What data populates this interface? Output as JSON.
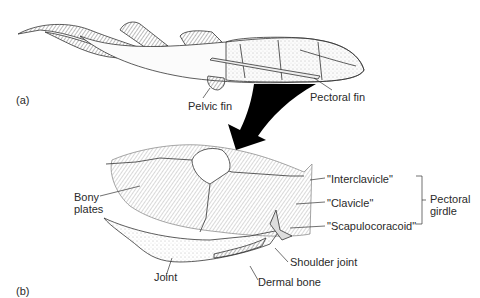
{
  "figure": {
    "panel_a": {
      "id_label": "(a)",
      "labels": {
        "pelvic_fin": "Pelvic fin",
        "pectoral_fin": "Pectoral fin"
      }
    },
    "panel_b": {
      "id_label": "(b)",
      "labels": {
        "bony_plates_line1": "Bony",
        "bony_plates_line2": "plates",
        "interclavicle": "\"Interclavicle\"",
        "clavicle": "\"Clavicle\"",
        "scapulocoracoid": "\"Scapulocoracoid\"",
        "pectoral_girdle_line1": "Pectoral",
        "pectoral_girdle_line2": "girdle",
        "shoulder_joint": "Shoulder joint",
        "joint": "Joint",
        "dermal_bone": "Dermal bone"
      }
    },
    "colors": {
      "ink": "#222222",
      "background": "#ffffff",
      "arrow": "#000000"
    }
  }
}
